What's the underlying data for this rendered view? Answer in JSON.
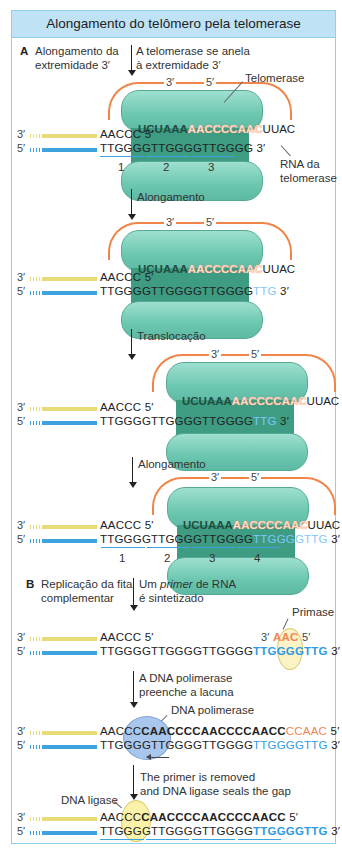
{
  "title": "Alongamento do telômero pela telomerase",
  "section_a": {
    "letter": "A",
    "label_line1": "Alongamento da",
    "label_line2": "extremidade 3′",
    "step1": {
      "caption_line1": "A telomerase se anela",
      "caption_line2": "à extremidade 3′",
      "telomerase_label": "Telomerase",
      "rna_label_line1": "RNA da",
      "rna_label_line2": "telomerase",
      "loop_3": "3′",
      "loop_5": "5′",
      "top_end": "3′",
      "bottom_end": "5′",
      "top_seq": "AACCC 5′",
      "bottom_seq": "TTGGGGTTGGGGTTGGGG",
      "bottom_seq_end": "3′",
      "rna_prefix": "UCUAAA",
      "rna_template": "AACCCCAAC",
      "rna_suffix": "UUAC",
      "repeat_numbers": [
        "1",
        "2",
        "3"
      ]
    },
    "step2": {
      "caption": "Alongamento",
      "loop_3": "3′",
      "loop_5": "5′",
      "top_end": "3′",
      "bottom_end": "5′",
      "top_seq": "AACCC 5′",
      "bottom_seq": "TTGGGGTTGGGGTTGGGG",
      "bottom_new": "TTG",
      "bottom_seq_end": "3′",
      "rna_prefix": "UCUAAA",
      "rna_template": "AACCCCAAC",
      "rna_suffix": "UUAC"
    },
    "step3": {
      "caption": "Translocação",
      "loop_3": "3′",
      "loop_5": "5′",
      "top_end": "3′",
      "bottom_end": "5′",
      "top_seq": "AACCC 5′",
      "bottom_seq": "TTGGGGTTGGGGTTGGGG",
      "bottom_new": "TTG",
      "bottom_seq_end": "3′",
      "rna_prefix": "UCUAAA",
      "rna_template": "AACCCCAAC",
      "rna_suffix": "UUAC"
    },
    "step4": {
      "caption": "Alongamento",
      "loop_3": "3′",
      "loop_5": "5′",
      "top_end": "3′",
      "bottom_end": "5′",
      "top_seq": "AACCC 5′",
      "bottom_seq": "TTGGGGTTGGGGTTGGGG",
      "bottom_new": "TTGGGGTTG",
      "bottom_seq_end": "3′",
      "rna_prefix": "UCUAAA",
      "rna_template": "AACCCCAAC",
      "rna_suffix": "UUAC",
      "repeat_numbers": [
        "1",
        "2",
        "3",
        "4"
      ]
    }
  },
  "section_b": {
    "letter": "B",
    "label_line1": "Replicação da fita",
    "label_line2": "complementar",
    "step1": {
      "caption_line1_pre": "Um ",
      "caption_line1_em": "primer",
      "caption_line1_post": " de RNA",
      "caption_line2": "é sintetizado",
      "primase_label": "Primase",
      "top_end": "3′",
      "bottom_end": "5′",
      "top_seq": "AACCC 5′",
      "primer_3": "3′",
      "primer_seq": "AAC",
      "primer_5": "5′",
      "bottom_seq": "TTGGGGTTGGGGTTGGGG",
      "bottom_new": "TTGGGGTTG",
      "bottom_seq_end": "3′"
    },
    "step2": {
      "caption_line1": "A DNA polimerase",
      "caption_line2": "preenche a lacuna",
      "polymerase_label": "DNA polimerase",
      "top_end": "3′",
      "bottom_end": "5′",
      "top_old": "AACCC",
      "top_new": "CAACCCCAACCCCAACC",
      "top_primer": "CCAAC",
      "top_seq_end": "5′",
      "bottom_seq": "TTGGGGTTGGGGTTGGGG",
      "bottom_new": "TTGGGGTTG",
      "bottom_seq_end": "3′"
    },
    "step3": {
      "caption_line1": "The primer is removed",
      "caption_line2": "and DNA ligase seals the gap",
      "ligase_label": "DNA ligase",
      "top_end": "3′",
      "bottom_end": "5′",
      "top_old": "AACCC",
      "top_new": "CAACCCCAACCCCAACC",
      "top_seq_end": "5′",
      "bottom_seq": "TTGGGGTTGGGGTTGGGG",
      "bottom_new": "TTGGGGTTG",
      "bottom_seq_end": "3′"
    }
  },
  "colors": {
    "header_bg": "#bfe2f4",
    "frame_border": "#8fd0ec",
    "telomerase": "#6cc7b0",
    "rna_loop": "#f0854a",
    "template_strand": "#e8db78",
    "new_dna": "#2f9be0",
    "primer": "#f0855a"
  }
}
